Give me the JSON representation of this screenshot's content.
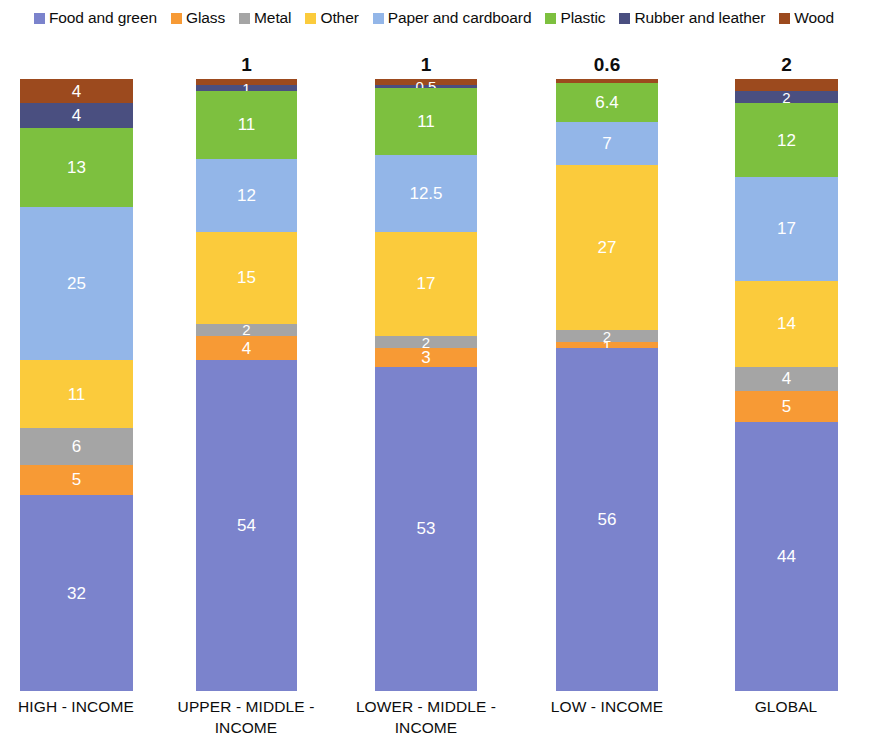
{
  "chart_data": {
    "type": "bar",
    "subtype": "stacked-bar-100",
    "title": "",
    "subtitle": "",
    "xlabel": "",
    "ylabel": "",
    "grid": false,
    "legend_position": "top",
    "ylim": [
      0,
      100
    ],
    "categories": [
      "HIGH - INCOME",
      "UPPER - MIDDLE - INCOME",
      "LOWER - MIDDLE - INCOME",
      "LOW - INCOME",
      "GLOBAL"
    ],
    "series": [
      {
        "name": "Food and green",
        "color": "#7B83CC",
        "values": [
          32,
          54,
          53,
          56,
          44
        ]
      },
      {
        "name": "Glass",
        "color": "#F79A35",
        "values": [
          5,
          4,
          3,
          1,
          5
        ]
      },
      {
        "name": "Metal",
        "color": "#A5A5A5",
        "values": [
          6,
          2,
          2,
          2,
          4
        ]
      },
      {
        "name": "Other",
        "color": "#FBCB3C",
        "values": [
          11,
          15,
          17,
          27,
          14
        ]
      },
      {
        "name": "Paper and cardboard",
        "color": "#93B6E8",
        "values": [
          25,
          12,
          12.5,
          7,
          17
        ]
      },
      {
        "name": "Plastic",
        "color": "#7DC03F",
        "values": [
          13,
          11,
          11,
          6.4,
          12
        ]
      },
      {
        "name": "Rubber and leather",
        "color": "#4A4F80",
        "values": [
          4,
          1,
          0.5,
          0,
          2
        ]
      },
      {
        "name": "Wood",
        "color": "#9C4A1E",
        "values": [
          4,
          1,
          1,
          0.6,
          2
        ]
      }
    ],
    "top_labels": [
      "",
      "1",
      "1",
      "0.6",
      "2"
    ],
    "inside_labels": {
      "HIGH - INCOME": {
        "Wood": "4",
        "Rubber and leather": "4",
        "Plastic": "13",
        "Paper and cardboard": "25",
        "Other": "11",
        "Metal": "6",
        "Glass": "5",
        "Food and green": "32"
      },
      "UPPER - MIDDLE - INCOME": {
        "Wood": "",
        "Rubber and leather": "1",
        "Plastic": "11",
        "Paper and cardboard": "12",
        "Other": "15",
        "Metal": "2",
        "Glass": "4",
        "Food and green": "54"
      },
      "LOWER - MIDDLE - INCOME": {
        "Wood": "",
        "Rubber and leather": "0.5",
        "Plastic": "11",
        "Paper and cardboard": "12.5",
        "Other": "17",
        "Metal": "2",
        "Glass": "3",
        "Food and green": "53"
      },
      "LOW - INCOME": {
        "Wood": "",
        "Rubber and leather": "",
        "Plastic": "6.4",
        "Paper and cardboard": "7",
        "Other": "27",
        "Metal": "2",
        "Glass": "1",
        "Food and green": "56"
      },
      "GLOBAL": {
        "Wood": "",
        "Rubber and leather": "2",
        "Plastic": "12",
        "Paper and cardboard": "17",
        "Other": "14",
        "Metal": "4",
        "Glass": "5",
        "Food and green": "44"
      }
    }
  },
  "legend": {
    "items": [
      {
        "label": "Food and green",
        "color": "#7B83CC",
        "icon": "legend-swatch-icon"
      },
      {
        "label": "Glass",
        "color": "#F79A35",
        "icon": "legend-swatch-icon"
      },
      {
        "label": "Metal",
        "color": "#A5A5A5",
        "icon": "legend-swatch-icon"
      },
      {
        "label": "Other",
        "color": "#FBCB3C",
        "icon": "legend-swatch-icon"
      },
      {
        "label": "Paper and cardboard",
        "color": "#93B6E8",
        "icon": "legend-swatch-icon"
      },
      {
        "label": "Plastic",
        "color": "#7DC03F",
        "icon": "legend-swatch-icon"
      },
      {
        "label": "Rubber and leather",
        "color": "#4A4F80",
        "icon": "legend-swatch-icon"
      },
      {
        "label": "Wood",
        "color": "#9C4A1E",
        "icon": "legend-swatch-icon"
      }
    ]
  },
  "axis": {
    "ticks": [
      {
        "lines": [
          "HIGH - INCOME"
        ]
      },
      {
        "lines": [
          "UPPER - MIDDLE -",
          "INCOME"
        ]
      },
      {
        "lines": [
          "LOWER - MIDDLE -",
          "INCOME"
        ]
      },
      {
        "lines": [
          "LOW - INCOME"
        ]
      },
      {
        "lines": [
          "GLOBAL"
        ]
      }
    ]
  },
  "geometry": {
    "bars": [
      {
        "left": 20,
        "width": 113
      },
      {
        "left": 196,
        "width": 101
      },
      {
        "left": 375,
        "width": 102
      },
      {
        "left": 556,
        "width": 102
      },
      {
        "left": 735,
        "width": 103
      }
    ],
    "stack_top": 37,
    "stack_bottom": 649,
    "tick_centers": [
      76,
      246,
      426,
      607,
      786
    ]
  }
}
